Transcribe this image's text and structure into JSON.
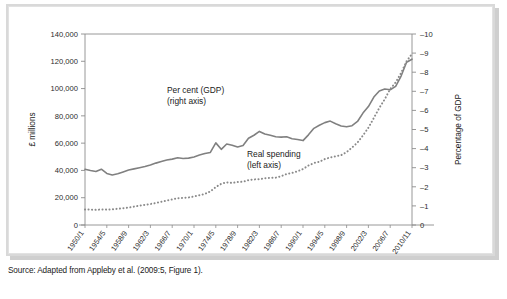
{
  "figure": {
    "source_note": "Source: Adapted from Appleby et al. (2009:5, Figure 1)."
  },
  "chart_data": {
    "type": "line",
    "title": "",
    "xlabel": "",
    "ylabel": "£ millions",
    "y2label": "Percentage of GDP",
    "grid": false,
    "legend_position": "inline-annotations",
    "ylim": [
      0,
      140000
    ],
    "y2lim": [
      0,
      10
    ],
    "yticks": [
      "0",
      "20,000",
      "40,000",
      "60,000",
      "80,000",
      "100,000",
      "120,000",
      "140,000"
    ],
    "ytick_values": [
      0,
      20000,
      40000,
      60000,
      80000,
      100000,
      120000,
      140000
    ],
    "y2ticks": [
      "0",
      "–1",
      "–2",
      "–3",
      "–4",
      "–5",
      "–6",
      "–7",
      "–8",
      "–9",
      "–10"
    ],
    "y2tick_values": [
      0,
      1,
      2,
      3,
      4,
      5,
      6,
      7,
      8,
      9,
      10
    ],
    "xtick_labels": [
      "1950/1",
      "1954/5",
      "1958/9",
      "1962/3",
      "1966/7",
      "1970/1",
      "1974/5",
      "1978/9",
      "1982/3",
      "1986/7",
      "1990/1",
      "1994/5",
      "1998/9",
      "2002/3",
      "2006/7",
      "2010/11"
    ],
    "x": [
      "1950/1",
      "1951/2",
      "1952/3",
      "1953/4",
      "1954/5",
      "1955/6",
      "1956/7",
      "1957/8",
      "1958/9",
      "1959/60",
      "1960/1",
      "1961/2",
      "1962/3",
      "1963/4",
      "1964/5",
      "1965/6",
      "1966/7",
      "1967/8",
      "1968/9",
      "1969/70",
      "1970/1",
      "1971/2",
      "1972/3",
      "1973/4",
      "1974/5",
      "1975/6",
      "1976/7",
      "1977/8",
      "1978/9",
      "1979/80",
      "1980/1",
      "1981/2",
      "1982/3",
      "1983/4",
      "1984/5",
      "1985/6",
      "1986/7",
      "1987/8",
      "1988/9",
      "1989/90",
      "1990/1",
      "1991/2",
      "1992/3",
      "1993/4",
      "1994/5",
      "1995/6",
      "1996/7",
      "1997/8",
      "1998/9",
      "1999/00",
      "2000/1",
      "2001/2",
      "2002/3",
      "2003/4",
      "2004/5",
      "2005/6",
      "2006/7",
      "2007/8",
      "2008/9",
      "2009/10",
      "2010/11"
    ],
    "annotations": [
      {
        "name": "per-cent-gdp",
        "line1": "Per cent (GDP)",
        "line2": "(right axis)"
      },
      {
        "name": "real-spending",
        "line1": "Real spending",
        "line2": "(left axis)"
      }
    ],
    "series": [
      {
        "name": "Per cent (GDP)",
        "axis": "right",
        "style": "solid",
        "color": "#808080",
        "unit": "% of GDP",
        "values": [
          2.92,
          2.85,
          2.8,
          2.92,
          2.7,
          2.62,
          2.68,
          2.78,
          2.88,
          2.94,
          3.0,
          3.06,
          3.14,
          3.24,
          3.32,
          3.4,
          3.45,
          3.52,
          3.48,
          3.5,
          3.56,
          3.66,
          3.74,
          3.8,
          4.3,
          3.96,
          4.24,
          4.18,
          4.08,
          4.16,
          4.54,
          4.7,
          4.9,
          4.76,
          4.7,
          4.62,
          4.6,
          4.62,
          4.52,
          4.48,
          4.42,
          4.72,
          5.06,
          5.22,
          5.36,
          5.44,
          5.3,
          5.18,
          5.14,
          5.2,
          5.42,
          5.86,
          6.2,
          6.7,
          7.02,
          7.12,
          7.08,
          7.26,
          7.8,
          8.52,
          8.68
        ]
      },
      {
        "name": "Real spending",
        "axis": "left",
        "style": "dotted",
        "color": "#8a8a8a",
        "unit": "£ millions",
        "values": [
          11400,
          11300,
          11100,
          11400,
          11250,
          11500,
          11900,
          12300,
          12800,
          13500,
          14200,
          14800,
          15400,
          16100,
          17000,
          17900,
          18700,
          19600,
          19900,
          20200,
          20900,
          21800,
          22800,
          24600,
          27800,
          30200,
          31300,
          30800,
          31500,
          31700,
          32900,
          33400,
          33600,
          34300,
          34600,
          34700,
          35800,
          37400,
          38200,
          39400,
          41000,
          43600,
          45400,
          46300,
          48300,
          49500,
          50400,
          51200,
          53400,
          56800,
          60400,
          65600,
          71300,
          78500,
          85800,
          92200,
          99700,
          104500,
          111500,
          120000,
          125500
        ]
      }
    ]
  }
}
